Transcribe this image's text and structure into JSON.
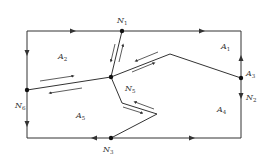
{
  "diagram": {
    "type": "network-graph",
    "nodes": [
      {
        "id": "N1",
        "label": "N",
        "sub": "1",
        "x": 122,
        "y": 31,
        "lx": 117,
        "ly": 23
      },
      {
        "id": "N2",
        "label": "N",
        "sub": "2",
        "x": 241,
        "y": 78,
        "lx": 246,
        "ly": 100
      },
      {
        "id": "N3",
        "label": "N",
        "sub": "3",
        "x": 111,
        "y": 138,
        "lx": 103,
        "ly": 152
      },
      {
        "id": "N5",
        "label": "N",
        "sub": "5",
        "x": 111,
        "y": 77,
        "lx": 125,
        "ly": 91
      },
      {
        "id": "N6",
        "label": "N",
        "sub": "6",
        "x": 27,
        "y": 90,
        "lx": 15,
        "ly": 108
      }
    ],
    "regions": [
      {
        "id": "A1",
        "label": "A",
        "sub": "1",
        "x": 221,
        "y": 49
      },
      {
        "id": "A2",
        "label": "A",
        "sub": "2",
        "x": 58,
        "y": 59
      },
      {
        "id": "A3",
        "label": "A",
        "sub": "3",
        "x": 246,
        "y": 76
      },
      {
        "id": "A4",
        "label": "A",
        "sub": "4",
        "x": 217,
        "y": 112
      },
      {
        "id": "A5",
        "label": "A",
        "sub": "5",
        "x": 76,
        "y": 118
      }
    ],
    "stroke_color": "#333333"
  }
}
